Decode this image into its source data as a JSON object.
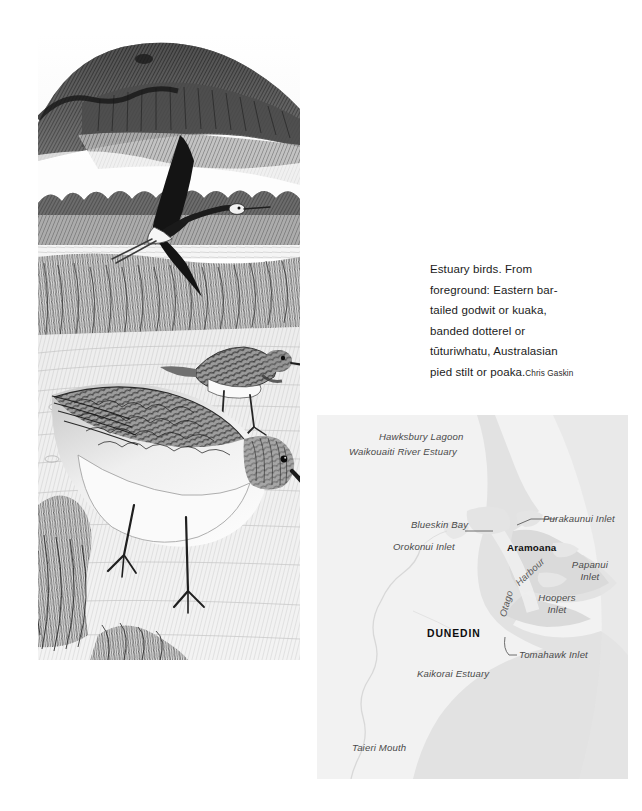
{
  "page": {
    "background_color": "#ffffff",
    "width": 642,
    "height": 811
  },
  "illustration": {
    "name": "estuary-birds-pencil-drawing",
    "medium": "pencil drawing",
    "scene_elements": [
      "headland hills",
      "flying Australasian pied stilt",
      "banded dotterel standing on mudflat",
      "Eastern bar-tailed godwit in foreground",
      "tidal flat and saltmarsh grasses"
    ]
  },
  "caption": {
    "text": "Estuary birds. From foreground: Eastern bar-tailed godwit or kuaka, banded dotterel or tūturiwhatu, Australasian pied stilt or poaka.",
    "credit": "Chris Gaskin",
    "lines": [
      "Estuary birds. From",
      "foreground: Eastern",
      "bar-tailed godwit or",
      "kuaka, banded dotterel or",
      "tūturiwhatu, Australasian",
      "pied stilt or poaka."
    ]
  },
  "map": {
    "title": "Otago coast estuaries map",
    "colors": {
      "background": "#f1f1f1",
      "land": "#ededed",
      "sea": "#e0e0e0",
      "peninsula": "#dcdcdc",
      "boundary_line": "#d2d2d2",
      "label": "#4a4a4a",
      "city_label": "#0d0d0d"
    },
    "labels": [
      {
        "id": "hawksbury-lagoon",
        "text": "Hawksbury Lagoon",
        "style": "italic"
      },
      {
        "id": "waikouaiti-river-estuary",
        "text": "Waikouaiti River Estuary",
        "style": "italic"
      },
      {
        "id": "blueskin-bay",
        "text": "Blueskin Bay",
        "style": "italic"
      },
      {
        "id": "orokonui-inlet",
        "text": "Orokonui Inlet",
        "style": "italic",
        "leader": true
      },
      {
        "id": "purakaunui-inlet",
        "text": "Purakaunui Inlet",
        "style": "italic",
        "leader": true
      },
      {
        "id": "aramoana",
        "text": "Aramoana",
        "style": "bold"
      },
      {
        "id": "otago",
        "text": "Otago",
        "style": "italic-rotated"
      },
      {
        "id": "harbour",
        "text": "Harbour",
        "style": "italic-rotated"
      },
      {
        "id": "papanui-inlet",
        "text": "Papanui Inlet",
        "style": "italic",
        "line1": "Papanui",
        "line2": "Inlet"
      },
      {
        "id": "hoopers-inlet",
        "text": "Hoopers Inlet",
        "style": "italic",
        "line1": "Hoopers",
        "line2": "Inlet"
      },
      {
        "id": "dunedin",
        "text": "DUNEDIN",
        "style": "bold-caps"
      },
      {
        "id": "tomahawk-inlet",
        "text": "Tomahawk Inlet",
        "style": "italic",
        "leader": true
      },
      {
        "id": "kaikorai-estuary",
        "text": "Kaikorai Estuary",
        "style": "italic"
      },
      {
        "id": "taieri-mouth",
        "text": "Taieri Mouth",
        "style": "italic"
      }
    ]
  }
}
